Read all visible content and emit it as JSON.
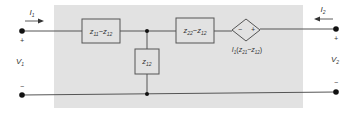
{
  "diagram": {
    "colors": {
      "background": "#ffffff",
      "shaded_region": "#e2e2e2",
      "wire": "#555555",
      "box_fill": "#e2e2e2",
      "text": "#333333",
      "node": "#111111"
    },
    "port1": {
      "current_label": "I",
      "current_sub": "1",
      "voltage_label": "V",
      "voltage_sub": "1",
      "plus": "+",
      "minus": "−"
    },
    "port2": {
      "current_label": "I",
      "current_sub": "2",
      "voltage_label": "V",
      "voltage_sub": "2",
      "plus": "+",
      "minus": "−"
    },
    "elements": {
      "series_left": {
        "z1": "z",
        "s1": "11",
        "op": "−",
        "z2": "z",
        "s2": "12"
      },
      "shunt": {
        "z": "z",
        "s": "12"
      },
      "series_right": {
        "z1": "z",
        "s1": "22",
        "op": "−",
        "z2": "z",
        "s2": "12"
      },
      "dependent_source": {
        "minus": "−",
        "plus": "+",
        "label_i": "I",
        "label_i_sub": "1",
        "label_open": "(",
        "z1": "z",
        "s1": "21",
        "op": "−",
        "z2": "z",
        "s2": "12",
        "label_close": ")"
      }
    }
  }
}
